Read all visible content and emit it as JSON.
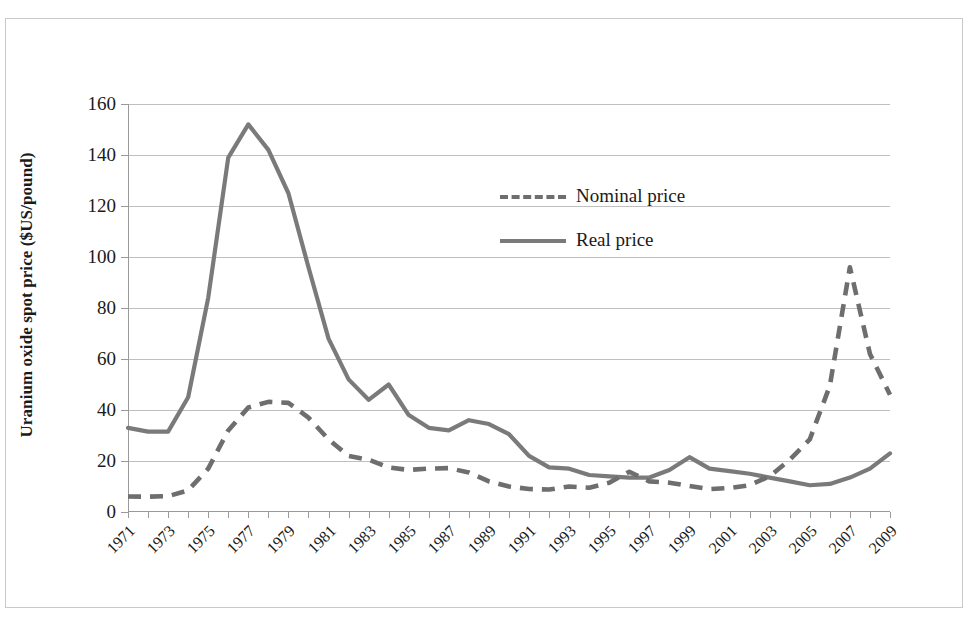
{
  "figure": {
    "title": "",
    "frame_color": "#c9c9c9"
  },
  "axes": {
    "ylabel": "Uranium oxide spot price ($US/pound)",
    "xlabel": "",
    "yticks": [
      "0",
      "20",
      "40",
      "60",
      "80",
      "100",
      "120",
      "140",
      "160"
    ],
    "xticklabels": [
      "1971",
      "1973",
      "1975",
      "1977",
      "1979",
      "1981",
      "1983",
      "1985",
      "1987",
      "1989",
      "1991",
      "1993",
      "1995",
      "1997",
      "1999",
      "2001",
      "2003",
      "2005",
      "2007",
      "2009"
    ]
  },
  "legend": {
    "position": "inside-upper-center",
    "entries": [
      {
        "label": "Nominal price",
        "style": "dashed",
        "color": "#6e6e6e"
      },
      {
        "label": "Real price",
        "style": "solid",
        "color": "#7a7a7a"
      }
    ]
  },
  "chart_data": {
    "type": "line",
    "title": "",
    "xlabel": "",
    "ylabel": "Uranium oxide spot price ($US/pound)",
    "xlim": [
      1971,
      2009
    ],
    "ylim": [
      0,
      160
    ],
    "ytick_step": 20,
    "grid": true,
    "legend_position": "inside-upper-center",
    "x": [
      1971,
      1972,
      1973,
      1974,
      1975,
      1976,
      1977,
      1978,
      1979,
      1980,
      1981,
      1982,
      1983,
      1984,
      1985,
      1986,
      1987,
      1988,
      1989,
      1990,
      1991,
      1992,
      1993,
      1994,
      1995,
      1996,
      1997,
      1998,
      1999,
      2000,
      2001,
      2002,
      2003,
      2004,
      2005,
      2006,
      2007,
      2008,
      2009
    ],
    "series": [
      {
        "name": "Nominal price",
        "style": "dashed",
        "color": "#6e6e6e",
        "values": [
          6.1,
          6.0,
          6.2,
          8.5,
          17.0,
          32.0,
          41.0,
          43.2,
          42.8,
          37.0,
          28.5,
          22.0,
          20.5,
          17.5,
          16.5,
          17.0,
          17.2,
          15.5,
          12.0,
          10.0,
          9.0,
          8.8,
          10.0,
          9.5,
          11.5,
          15.8,
          12.0,
          11.5,
          10.2,
          9.0,
          9.4,
          10.5,
          14.0,
          20.5,
          28.5,
          49.5,
          96.0,
          62.0,
          46.0
        ]
      },
      {
        "name": "Real price",
        "style": "solid",
        "color": "#7a7a7a",
        "values": [
          33.0,
          31.5,
          31.5,
          45.0,
          84.0,
          139.0,
          152.0,
          142.0,
          125.0,
          96.0,
          68.0,
          52.0,
          44.0,
          50.0,
          38.0,
          33.0,
          32.0,
          36.0,
          34.5,
          30.5,
          22.0,
          17.5,
          17.0,
          14.5,
          14.0,
          13.5,
          13.5,
          16.5,
          21.5,
          17.0,
          16.0,
          15.0,
          13.5,
          12.0,
          10.5,
          11.0,
          13.5,
          17.0,
          23.0
        ]
      }
    ],
    "notes": {
      "real_peak": {
        "year": 1977,
        "value": 152
      },
      "nominal_peak_1970s": {
        "year": 1978,
        "value": 43
      },
      "secondary_peak": {
        "year": 2007,
        "real": 104,
        "nominal": 96
      },
      "local_bump": {
        "year": 1996,
        "real": 21.5
      },
      "final_point": {
        "year": 2009,
        "real": 46,
        "nominal": 46
      }
    }
  }
}
